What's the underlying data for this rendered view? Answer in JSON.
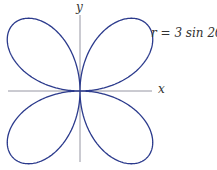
{
  "chart_data": {
    "type": "line",
    "subtype": "polar-curve",
    "title": "",
    "equation": "r = 3 sin 2θ",
    "xlabel": "x",
    "ylabel": "y",
    "grid": false,
    "legend": null,
    "series": [
      {
        "name": "r = 3 sin 2θ",
        "color": "#2b3a8c",
        "r_max": 3,
        "theta_range": [
          0,
          6.283185307179586
        ],
        "petals": 4
      }
    ],
    "xlim": [
      -2.6,
      2.6
    ],
    "ylim": [
      -2.6,
      2.6
    ]
  },
  "labels": {
    "x_axis": "x",
    "y_axis": "y",
    "curve": "r = 3 sin 2θ"
  },
  "colors": {
    "curve": "#2b3a8c",
    "axis": "#8a8a99"
  }
}
